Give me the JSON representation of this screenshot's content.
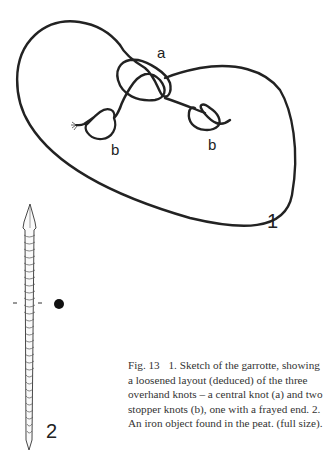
{
  "figure": {
    "labels": {
      "a": "a",
      "b_left": "b",
      "b_right": "b",
      "one": "1",
      "two": "2"
    },
    "caption": {
      "fig_number": "Fig. 13",
      "text": "1. Sketch of the garrotte, showing a loosened layout (deduced) of the three overhand knots – a central knot (a) and two stopper knots (b), one with a frayed end. 2. An iron object found in the peat. (full size)."
    },
    "colors": {
      "ink": "#222222",
      "caption_text": "#333333",
      "background": "#ffffff"
    }
  }
}
